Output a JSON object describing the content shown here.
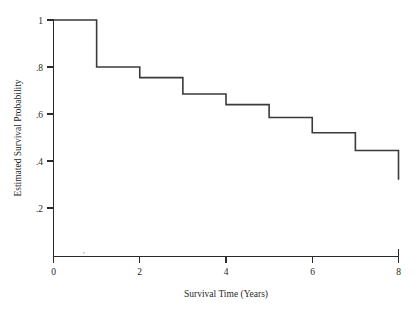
{
  "chart_data": {
    "type": "line",
    "subtype": "kaplan-meier-step",
    "title": "",
    "xlabel": "Survival Time (Years)",
    "ylabel": "Estimated Survival Probability",
    "xlim": [
      0,
      8
    ],
    "ylim": [
      0,
      1
    ],
    "grid": false,
    "legend": false,
    "xticks": [
      0,
      2,
      4,
      6,
      8
    ],
    "xtick_labels": [
      "0",
      "2",
      "4",
      "6",
      "8"
    ],
    "yticks": [
      0.2,
      0.4,
      0.6,
      0.8,
      1.0
    ],
    "ytick_labels": [
      ".2",
      ".4",
      ".6",
      ".8",
      "1"
    ],
    "x": [
      0,
      1,
      2,
      3,
      4,
      5,
      6,
      7,
      8
    ],
    "values": [
      1.0,
      0.8,
      0.755,
      0.685,
      0.64,
      0.585,
      0.52,
      0.445,
      0.32
    ],
    "step_segments": [
      {
        "x_start": 0,
        "x_end": 1,
        "y": 1.0
      },
      {
        "x_start": 1,
        "x_end": 2,
        "y": 0.8
      },
      {
        "x_start": 2,
        "x_end": 3,
        "y": 0.755
      },
      {
        "x_start": 3,
        "x_end": 4,
        "y": 0.685
      },
      {
        "x_start": 4,
        "x_end": 5,
        "y": 0.64
      },
      {
        "x_start": 5,
        "x_end": 6,
        "y": 0.585
      },
      {
        "x_start": 6,
        "x_end": 7,
        "y": 0.52
      },
      {
        "x_start": 7,
        "x_end": 8,
        "y": 0.445
      }
    ],
    "terminal_drop": {
      "x": 8,
      "y_from": 0.445,
      "y_to": 0.32
    },
    "series": [
      {
        "name": "Estimated Survival Probability",
        "x": [
          0,
          1,
          2,
          3,
          4,
          5,
          6,
          7,
          8
        ],
        "values": [
          1.0,
          0.8,
          0.755,
          0.685,
          0.64,
          0.585,
          0.52,
          0.445,
          0.32
        ]
      }
    ],
    "colors": {
      "curve": "#3a3a3a",
      "axis": "#2b2b2b",
      "background": "#ffffff",
      "text": "#1f1f1f"
    }
  }
}
